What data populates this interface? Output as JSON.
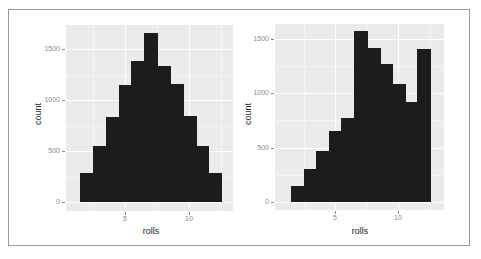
{
  "chart_data": [
    {
      "type": "bar",
      "title": "",
      "xlabel": "rolls",
      "ylabel": "count",
      "categories": [
        2,
        3,
        4,
        5,
        6,
        7,
        8,
        9,
        10,
        11,
        12
      ],
      "values": [
        280,
        550,
        830,
        1150,
        1380,
        1660,
        1330,
        1160,
        840,
        550,
        280
      ],
      "x_ticks": [
        "5",
        "10"
      ],
      "y_ticks": [
        "0",
        "500",
        "1000",
        "1500"
      ],
      "ylim": [
        0,
        1750
      ],
      "grid": true
    },
    {
      "type": "bar",
      "title": "",
      "xlabel": "rolls",
      "ylabel": "count",
      "categories": [
        2,
        3,
        4,
        5,
        6,
        7,
        8,
        9,
        10,
        11,
        12
      ],
      "values": [
        150,
        300,
        470,
        650,
        770,
        1570,
        1410,
        1270,
        1080,
        920,
        1400
      ],
      "x_ticks": [
        "5",
        "10"
      ],
      "y_ticks": [
        "0",
        "500",
        "1000",
        "1500"
      ],
      "ylim": [
        0,
        1620
      ],
      "grid": true
    }
  ],
  "colors": {
    "bar": "#1c1c1c",
    "panel_bg": "#ebebeb",
    "grid": "#ffffff"
  }
}
